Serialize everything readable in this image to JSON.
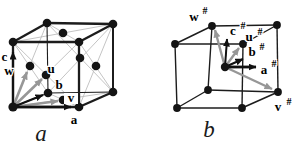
{
  "figures": [
    {
      "caption": "a",
      "labels": {
        "a": "a",
        "b": "b",
        "c": "c",
        "u": "u",
        "v": "v",
        "w": "w"
      }
    },
    {
      "caption": "b",
      "superscript": "#",
      "labels": {
        "a": "a",
        "b": "b",
        "c": "c",
        "u": "u",
        "v": "v",
        "w": "w"
      }
    }
  ],
  "colors": {
    "background": "#ffffff",
    "edge": "#1c1c1c",
    "atom": "#141414",
    "black_arrow": "#111111",
    "gray_arrow": "#979797",
    "thin_diagonal": "#bdbdbd",
    "label": "#000000"
  }
}
